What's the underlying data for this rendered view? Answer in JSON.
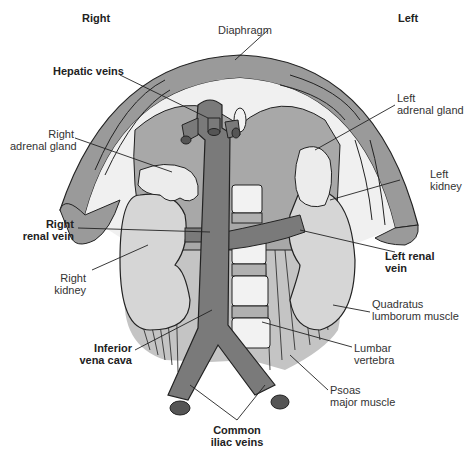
{
  "orientation": {
    "right": "Right",
    "left": "Left"
  },
  "labels": {
    "diaphragm": "Diaphragm",
    "hepatic_veins": "Hepatic veins",
    "right_adrenal_gland": [
      "Right",
      "adrenal gland"
    ],
    "left_adrenal_gland": [
      "Left",
      "adrenal gland"
    ],
    "left_kidney": [
      "Left",
      "kidney"
    ],
    "right_renal_vein": [
      "Right",
      "renal vein"
    ],
    "left_renal_vein": [
      "Left renal",
      "vein"
    ],
    "right_kidney": [
      "Right",
      "kidney"
    ],
    "quadratus_lumborum": [
      "Quadratus",
      "lumborum muscle"
    ],
    "inferior_vena_cava": [
      "Inferior",
      "vena cava"
    ],
    "lumbar_vertebra": [
      "Lumbar",
      "vertebra"
    ],
    "psoas_major": [
      "Psoas",
      "major muscle"
    ],
    "common_iliac_veins": [
      "Common",
      "iliac veins"
    ]
  },
  "colors": {
    "vein": "#7a7a7a",
    "vein_end": "#555555",
    "diaphragm_band": "#9a9a9a",
    "liver_region": "#b8b8b8",
    "kidney": "#d6d6d6",
    "adrenal": "#ececec",
    "muscle": "#c4c4c4",
    "vertebra": "#f2f2f2",
    "outline": "#222222"
  }
}
